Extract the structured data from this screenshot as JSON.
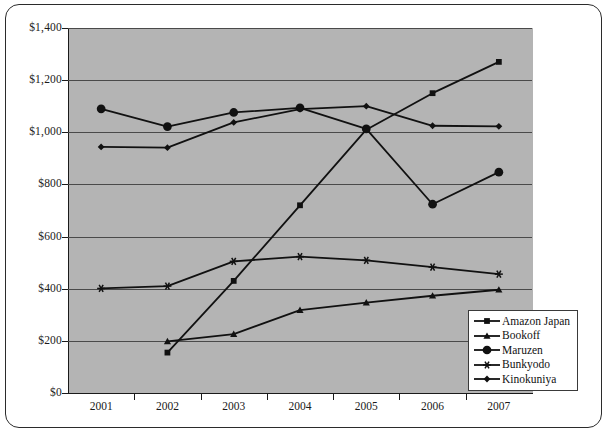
{
  "chart_data": {
    "type": "line",
    "title": "",
    "subtitle": "",
    "xlabel": "",
    "ylabel": "",
    "categories": [
      "2001",
      "2002",
      "2003",
      "2004",
      "2005",
      "2006",
      "2007"
    ],
    "xtick_labels": [
      "2001",
      "2002",
      "2003",
      "2004",
      "2005",
      "2006",
      "2007"
    ],
    "ytick_labels": [
      "$0",
      "$200",
      "$400",
      "$600",
      "$800",
      "$1,000",
      "$1,200",
      "$1,400"
    ],
    "ytick_values": [
      0,
      200,
      400,
      600,
      800,
      1000,
      1200,
      1400
    ],
    "ylim": [
      0,
      1400
    ],
    "grid": "horizontal",
    "legend_position": "bottom-right",
    "plot_background": "#b4b4b4",
    "series": [
      {
        "name": "Amazon Japan",
        "marker": "square",
        "color": "#111111",
        "values": [
          null,
          155,
          430,
          720,
          1010,
          1150,
          1270
        ]
      },
      {
        "name": "Bookoff",
        "marker": "triangle",
        "color": "#111111",
        "values": [
          null,
          198,
          226,
          318,
          347,
          373,
          396
        ]
      },
      {
        "name": "Maruzen",
        "marker": "circle",
        "color": "#111111",
        "values": [
          1090,
          1022,
          1076,
          1094,
          1013,
          724,
          847
        ]
      },
      {
        "name": "Bunkyodo",
        "marker": "asterisk",
        "color": "#111111",
        "values": [
          401,
          410,
          505,
          523,
          509,
          483,
          456
        ]
      },
      {
        "name": "Kinokuniya",
        "marker": "diamond",
        "color": "#111111",
        "values": [
          944,
          941,
          1038,
          1089,
          1100,
          1025,
          1023
        ]
      }
    ]
  },
  "legend": {
    "items": [
      {
        "label": "Amazon Japan",
        "marker": "square"
      },
      {
        "label": "Bookoff",
        "marker": "triangle"
      },
      {
        "label": "Maruzen",
        "marker": "circle"
      },
      {
        "label": "Bunkyodo",
        "marker": "asterisk"
      },
      {
        "label": "Kinokuniya",
        "marker": "diamond"
      }
    ]
  }
}
